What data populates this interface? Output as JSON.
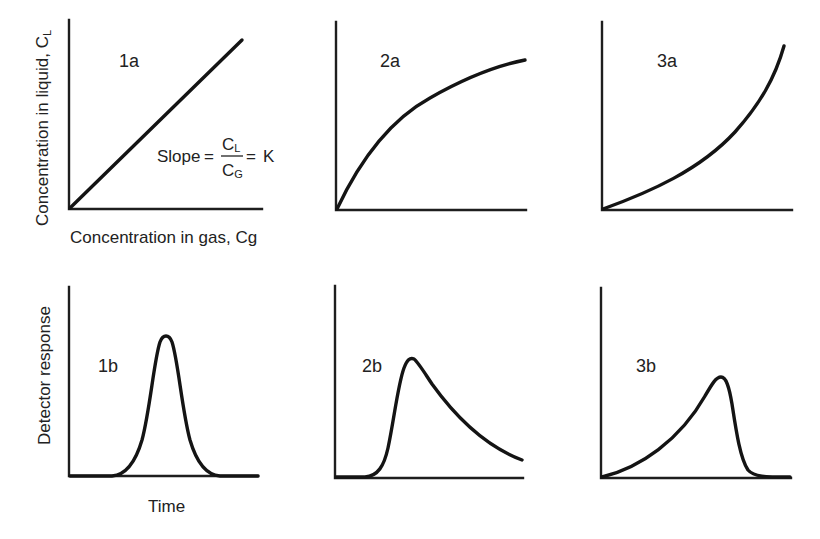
{
  "figure": {
    "ylabel_top": "Concentration in liquid, C",
    "ylabel_top_sub": "L",
    "xlabel_top": "Concentration in gas, Cg",
    "ylabel_bottom": "Detector response",
    "xlabel_bottom": "Time",
    "formula": {
      "prefix": "Slope",
      "equals": "=",
      "numerator": "C",
      "numerator_sub": "L",
      "denominator": "C",
      "denominator_sub": "G",
      "suffix": "K"
    },
    "panels": [
      {
        "id": "1a",
        "label": "1a",
        "description": "Linear isotherm (straight line through origin)"
      },
      {
        "id": "2a",
        "label": "2a",
        "description": "Concave isotherm (Langmuir-type, saturating)"
      },
      {
        "id": "3a",
        "label": "3a",
        "description": "Convex isotherm (anti-Langmuir, upward curving)"
      },
      {
        "id": "1b",
        "label": "1b",
        "description": "Symmetric Gaussian peak"
      },
      {
        "id": "2b",
        "label": "2b",
        "description": "Tailing peak (sharp front, long tail)"
      },
      {
        "id": "3b",
        "label": "3b",
        "description": "Fronting peak (gradual front, sharp back)"
      }
    ],
    "colors": {
      "line": "#141414",
      "axis": "#1e1e1e",
      "text": "#222222",
      "background": "#ffffff"
    }
  }
}
